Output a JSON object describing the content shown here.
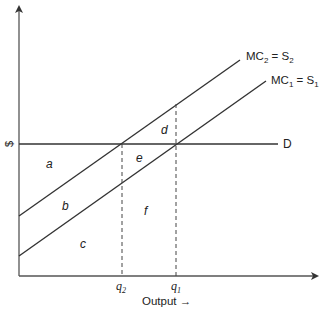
{
  "diagram": {
    "y_axis_label": "$",
    "x_axis_label": "Output →",
    "curves": [
      {
        "id": "mc2",
        "label_main": "MC",
        "label_sub": "2",
        "label_eq": " = S",
        "label_sub2": "2"
      },
      {
        "id": "mc1",
        "label_main": "MC",
        "label_sub": "1",
        "label_eq": " = S",
        "label_sub2": "1"
      },
      {
        "id": "demand",
        "label": "D"
      }
    ],
    "quantities": [
      {
        "id": "q2",
        "letter": "q",
        "sub": "2"
      },
      {
        "id": "q1",
        "letter": "q",
        "sub": "1"
      }
    ],
    "areas": [
      "a",
      "b",
      "c",
      "d",
      "e",
      "f"
    ]
  }
}
